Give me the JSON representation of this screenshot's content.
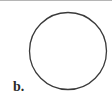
{
  "figure": {
    "label": "b.",
    "shape": "circle",
    "stroke_color": "#3a3a3a",
    "fill_color": "#ffffff"
  },
  "colors": {
    "top_rule": "#b5b5b5",
    "background": "#ffffff"
  }
}
